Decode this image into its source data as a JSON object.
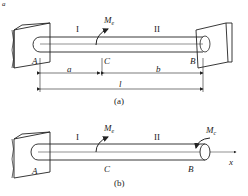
{
  "corner_mark": "a",
  "figure_a": {
    "caption": "(a)",
    "segment_1": "I",
    "segment_2": "II",
    "moment_label": "M",
    "moment_sub": "e",
    "point_A": "A",
    "point_B": "B",
    "point_C": "C",
    "dim_a": "a",
    "dim_b": "b",
    "dim_l": "l"
  },
  "figure_b": {
    "caption": "(b)",
    "segment_1": "I",
    "segment_2": "II",
    "moment_label_1": "M",
    "moment_sub_1": "e",
    "moment_label_2": "M",
    "moment_sub_2": "c",
    "point_A": "A",
    "point_B": "B",
    "point_C": "C",
    "axis_x": "x"
  },
  "colors": {
    "stroke": "#222222",
    "background": "#ffffff"
  }
}
